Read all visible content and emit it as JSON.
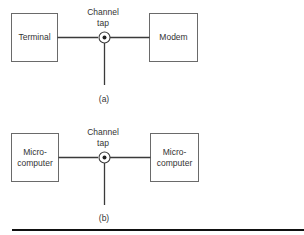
{
  "diagram_a": {
    "left_box": {
      "lines": [
        "Terminal"
      ]
    },
    "right_box": {
      "lines": [
        "Modem"
      ]
    },
    "tap_label": [
      "Channel",
      "tap"
    ],
    "caption": "(a)"
  },
  "diagram_b": {
    "left_box": {
      "lines": [
        "Micro-",
        "computer"
      ]
    },
    "right_box": {
      "lines": [
        "Micro-",
        "computer"
      ]
    },
    "tap_label": [
      "Channel",
      "tap"
    ],
    "caption": "(b)"
  },
  "colors": {
    "stroke": "#3a3a3a",
    "box": "#6a6a6a",
    "rule": "#111111"
  }
}
